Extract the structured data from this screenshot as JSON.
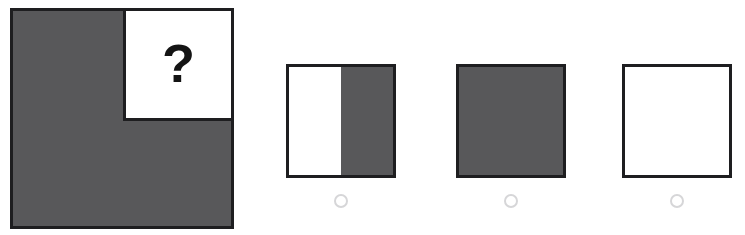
{
  "puzzle": {
    "type": "visual-pattern-completion",
    "colors": {
      "shape_fill": "#58585a",
      "shape_stroke": "#1e1e20",
      "background": "#ffffff",
      "radio_stroke": "#d6d6d8"
    },
    "prompt": {
      "label": "prompt-figure",
      "outer_shape": "square",
      "outer_fill": "gray",
      "inset_shape": "square",
      "inset_position": "top-right",
      "inset_fill": "white",
      "question_mark": "?"
    },
    "options": [
      {
        "id": "option-1",
        "shape": "square",
        "fill_description": "left half white, right half gray",
        "fill_kind": "split-vertical-right-gray",
        "selected": false
      },
      {
        "id": "option-2",
        "shape": "square",
        "fill_description": "solid gray",
        "fill_kind": "solid-gray",
        "selected": false
      },
      {
        "id": "option-3",
        "shape": "square",
        "fill_description": "solid white",
        "fill_kind": "solid-white",
        "selected": false
      }
    ]
  }
}
